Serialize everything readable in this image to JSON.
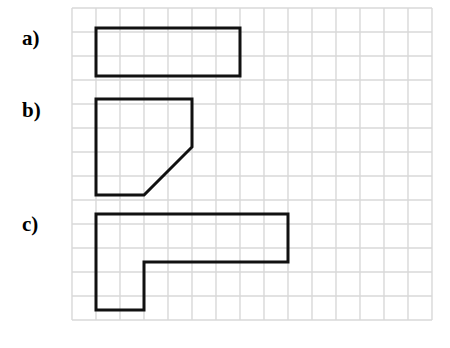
{
  "figure": {
    "background_color": "#ffffff",
    "width": 450,
    "height": 348
  },
  "grid": {
    "origin_x": 72,
    "origin_y": 8,
    "cell_size": 24,
    "columns": 15,
    "rows": 13,
    "line_color": "#d8d8d8",
    "line_width": 1.4
  },
  "labels": {
    "a": "a)",
    "b": "b)",
    "c": "c)"
  },
  "shapes": {
    "stroke_color": "#111111",
    "stroke_width": 3,
    "fill": "none",
    "items": [
      {
        "id": "shape-a",
        "label": "a)",
        "kind": "rectangle",
        "grid_cells_wide": 6,
        "grid_cells_tall": 2,
        "points": "96,28 240,28 240,76 96,76"
      },
      {
        "id": "shape-b",
        "label": "b)",
        "kind": "pentagon",
        "grid_cells_wide": 4,
        "grid_cells_tall": 4,
        "points": "96,99 192,99 192,147 144,195 96,195"
      },
      {
        "id": "shape-c",
        "label": "c)",
        "kind": "l-shape",
        "grid_cells_wide": 8,
        "grid_cells_tall": 4,
        "points": "96,214 288,214 288,262 144,262 144,310 96,310"
      }
    ]
  }
}
